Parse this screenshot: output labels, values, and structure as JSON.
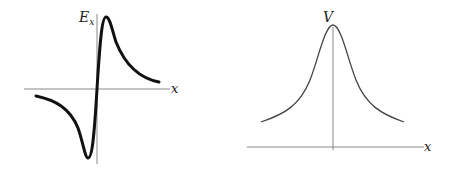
{
  "figures": [
    {
      "id": "ex-plot",
      "y_axis_label": "E",
      "y_axis_label_subscript": "x",
      "x_axis_label": "x",
      "curve_description": "antisymmetric field curve: negative trough left of origin, positive peak right of origin",
      "curve_color": "#111111",
      "axis_color": "#888888"
    },
    {
      "id": "v-plot",
      "y_axis_label": "V",
      "x_axis_label": "x",
      "curve_description": "symmetric potential peak centered on origin",
      "curve_color": "#444444",
      "axis_color": "#888888"
    }
  ]
}
